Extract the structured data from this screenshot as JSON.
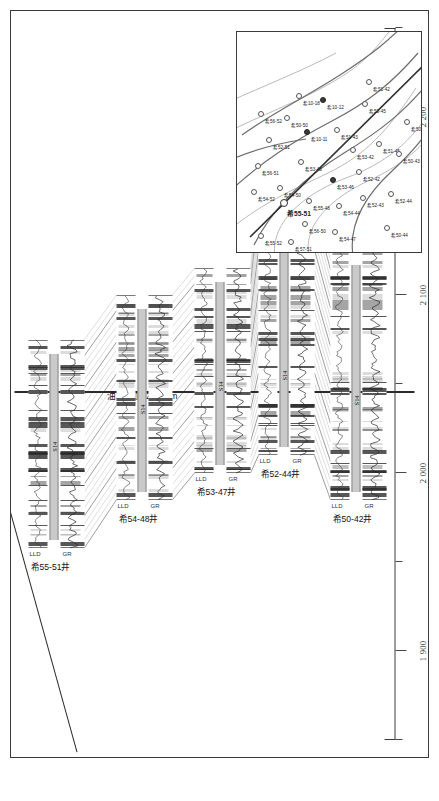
{
  "figure": {
    "type": "well-log-correlation-cross-section",
    "orientation": "rotated-90-ccw",
    "axis_title": "埋深/m",
    "owc_label": "油水界面-2 045 m",
    "marker_name": "S14"
  },
  "depth_axis": {
    "label": "埋深/m",
    "unit": "m",
    "min": 1850,
    "max": 2250,
    "major_ticks": [
      1900,
      2000,
      2100,
      2200
    ],
    "major_tick_labels": [
      "1 900",
      "2 000",
      "2 100",
      "2 200"
    ],
    "minor_ticks": [
      1850,
      1950,
      2050,
      2150,
      2250
    ],
    "owc_depth": 2045
  },
  "wells": [
    {
      "name": "希55-51井",
      "short": "希55-51",
      "tracks": [
        "GR",
        "LLD"
      ],
      "marker": "S14",
      "top_depth": 1958,
      "base_depth": 2075,
      "marker_depth": 2012
    },
    {
      "name": "希54-48井",
      "short": "希54-48",
      "tracks": [
        "GR",
        "LLD"
      ],
      "marker": "S14",
      "top_depth": 1985,
      "base_depth": 2100,
      "marker_depth": 2033
    },
    {
      "name": "希53-47井",
      "short": "希53-47",
      "tracks": [
        "GR",
        "LLD"
      ],
      "marker": "S14",
      "top_depth": 2000,
      "base_depth": 2115,
      "marker_depth": 2046
    },
    {
      "name": "希52-44井",
      "short": "希52-44",
      "tracks": [
        "GR",
        "LLD"
      ],
      "marker": "S14",
      "top_depth": 2010,
      "base_depth": 2160,
      "marker_depth": 2052
    },
    {
      "name": "希50-42井",
      "short": "希50-42",
      "tracks": [
        "GR",
        "LLD"
      ],
      "marker": "S14",
      "top_depth": 1985,
      "base_depth": 2125,
      "marker_depth": 2038
    }
  ],
  "track_labels": {
    "gr": "GR",
    "lld": "LLD"
  },
  "inset_map": {
    "section_well": "希55-51",
    "wells": [
      {
        "label": "希55-52",
        "x": 14,
        "y": 22,
        "state": "open"
      },
      {
        "label": "希57-51",
        "x": 8,
        "y": 52,
        "state": "open"
      },
      {
        "label": "希55-51",
        "x": 46,
        "y": 44,
        "state": "section"
      },
      {
        "label": "希54-50",
        "x": 62,
        "y": 41,
        "state": "open"
      },
      {
        "label": "希54-52",
        "x": 58,
        "y": 15,
        "state": "open"
      },
      {
        "label": "希56-51",
        "x": 84,
        "y": 19,
        "state": "open"
      },
      {
        "label": "希56-50",
        "x": 26,
        "y": 66,
        "state": "open"
      },
      {
        "label": "希55-48",
        "x": 49,
        "y": 70,
        "state": "open"
      },
      {
        "label": "希53-48",
        "x": 88,
        "y": 62,
        "state": "open"
      },
      {
        "label": "希54-47",
        "x": 18,
        "y": 96,
        "state": "open"
      },
      {
        "label": "希54-44",
        "x": 44,
        "y": 100,
        "state": "open"
      },
      {
        "label": "希53-46",
        "x": 70,
        "y": 94,
        "state": "filled"
      },
      {
        "label": "希52-43",
        "x": 52,
        "y": 124,
        "state": "open"
      },
      {
        "label": "希52-42",
        "x": 78,
        "y": 120,
        "state": "open"
      },
      {
        "label": "希53-42",
        "x": 100,
        "y": 114,
        "state": "open"
      },
      {
        "label": "希51-45",
        "x": 106,
        "y": 140,
        "state": "open"
      },
      {
        "label": "希51-43",
        "x": 120,
        "y": 98,
        "state": "open"
      },
      {
        "label": "希52-51",
        "x": 110,
        "y": 30,
        "state": "open"
      },
      {
        "label": "希56-52",
        "x": 136,
        "y": 22,
        "state": "open"
      },
      {
        "label": "希50-50",
        "x": 132,
        "y": 48,
        "state": "open"
      },
      {
        "label": "希10-11",
        "x": 118,
        "y": 68,
        "state": "filled"
      },
      {
        "label": "希10-18",
        "x": 154,
        "y": 60,
        "state": "open"
      },
      {
        "label": "希10-12",
        "x": 150,
        "y": 84,
        "state": "filled"
      },
      {
        "label": "希53-45",
        "x": 146,
        "y": 126,
        "state": "open"
      },
      {
        "label": "希51-42",
        "x": 168,
        "y": 130,
        "state": "open"
      },
      {
        "label": "希50-44",
        "x": 22,
        "y": 148,
        "state": "open"
      },
      {
        "label": "希52-44",
        "x": 56,
        "y": 152,
        "state": "open"
      },
      {
        "label": "希50-43",
        "x": 96,
        "y": 160,
        "state": "open"
      },
      {
        "label": "希50-42",
        "x": 128,
        "y": 168,
        "state": "open"
      }
    ]
  },
  "colors": {
    "frame": "#3a3a3a",
    "axis": "#3c3c3c",
    "owc": "#2a2a2a",
    "sand": "#4a4a4a",
    "marker_band": "#c9c9c9",
    "tie_line": "#9a9a9a"
  }
}
